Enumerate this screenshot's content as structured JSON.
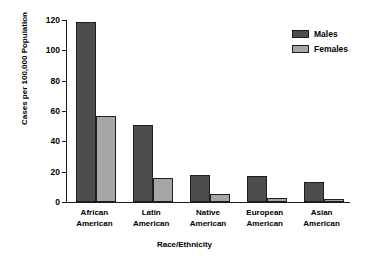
{
  "chart_data": {
    "type": "bar",
    "title": "",
    "subtitle": "",
    "xlabel": "Race/Ethnicity",
    "ylabel": "Cases per 100,000 Population",
    "categories": [
      "African American",
      "Latin American",
      "Native American",
      "European American",
      "Asian American"
    ],
    "category_lines": [
      [
        "African",
        "American"
      ],
      [
        "Latin",
        "American"
      ],
      [
        "Native",
        "American"
      ],
      [
        "European",
        "American"
      ],
      [
        "Asian",
        "American"
      ]
    ],
    "series": [
      {
        "name": "Males",
        "color": "#4d4d4d",
        "values": [
          119,
          51,
          18,
          17,
          13
        ]
      },
      {
        "name": "Females",
        "color": "#a6a6a6",
        "values": [
          57,
          16,
          5,
          2.5,
          2
        ]
      }
    ],
    "ylim": [
      0,
      120
    ],
    "yticks": [
      0,
      20,
      40,
      60,
      80,
      100,
      120
    ],
    "ytick_labels": [
      "0",
      "20",
      "40",
      "60",
      "80",
      "100",
      "120"
    ],
    "grid": false,
    "legend_position": "top-right",
    "bar_border_color": "#1f1f1f",
    "axis_color": "#1a1a1a"
  }
}
